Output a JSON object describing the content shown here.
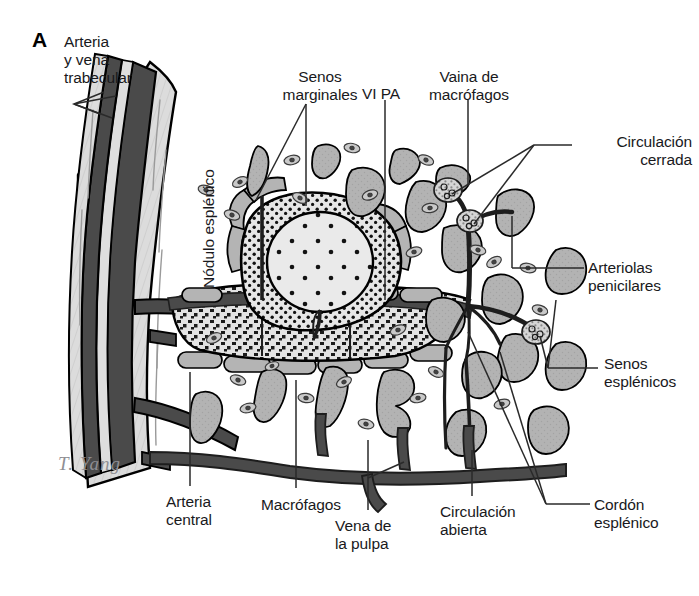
{
  "figure": {
    "panel_letter": "A",
    "signature": "T. Yang",
    "width": 699,
    "height": 596,
    "background": "#ffffff"
  },
  "colors": {
    "outline": "#000000",
    "vessel_dark": "#4a4a4a",
    "vessel_very_dark": "#2b2b2b",
    "trabecula_light": "#d9d9d9",
    "sinusoid_gray": "#b0b0b0",
    "nodule_fill": "#e8e8e8",
    "cord_fill": "#dcdcdc",
    "leader_line": "#2a2a2a",
    "text": "#19191c"
  },
  "labels": [
    {
      "id": "arteria-y-vena-trabecular",
      "text": "Arteria\ny vena\ntrabecular",
      "x": 64,
      "y": 33,
      "align": "left"
    },
    {
      "id": "senos-marginales",
      "text": "Senos\nmarginales",
      "x": 272,
      "y": 68,
      "align": "center"
    },
    {
      "id": "vl-pa",
      "text": "VI PA",
      "x": 362,
      "y": 85,
      "align": "left"
    },
    {
      "id": "vaina-de-macrofagos",
      "text": "Vaina de\nmacrófagos",
      "x": 432,
      "y": 68,
      "align": "center"
    },
    {
      "id": "circulacion-cerrada",
      "text": "Circulación\ncerrada",
      "x": 578,
      "y": 133,
      "align": "left"
    },
    {
      "id": "arteriolas-penicilares",
      "text": "Arteriolas\npenicilares",
      "x": 588,
      "y": 259,
      "align": "left"
    },
    {
      "id": "senos-esplenicos",
      "text": "Senos\nesplénicos",
      "x": 604,
      "y": 355,
      "align": "left"
    },
    {
      "id": "cordon-esplenico",
      "text": "Cordón\nesplénico",
      "x": 594,
      "y": 496,
      "align": "left"
    },
    {
      "id": "arteria-central",
      "text": "Arteria\ncentral",
      "x": 166,
      "y": 493,
      "align": "left"
    },
    {
      "id": "macrofagos",
      "text": "Macrófagos",
      "x": 261,
      "y": 496,
      "align": "left"
    },
    {
      "id": "vena-de-la-pulpa",
      "text": "Vena de\nla pulpa",
      "x": 335,
      "y": 517,
      "align": "left"
    },
    {
      "id": "circulacion-abierta",
      "text": "Circulación\nabierta",
      "x": 440,
      "y": 503,
      "align": "left"
    }
  ],
  "vertical_labels": [
    {
      "id": "nodulo-esplenico",
      "text": "Nódulo esplénico",
      "x": 200,
      "y": 280
    }
  ],
  "structures": {
    "trabecula": "Trabécula con arteria y vena trabecular seccionadas longitudinalmente",
    "nodulo": "Nódulo linfático esplénico (pulpa blanca) con centro germinal",
    "cordon": "Cordón esplénico (pulpa roja) punteado",
    "senos": "Senos esplénicos representados como siluetas grises irregulares",
    "macrofagos": "Macrófagos dibujados como pequeñas células ovaladas grises",
    "arteriolas": "Arteriolas penicilares con vainas de macrófagos (elipsoides)"
  }
}
